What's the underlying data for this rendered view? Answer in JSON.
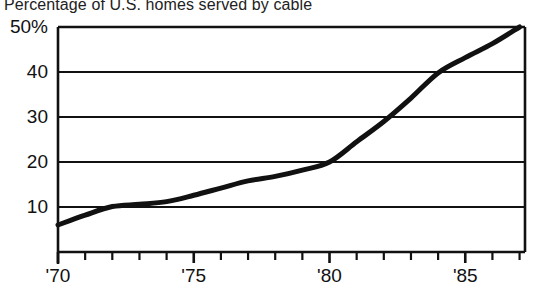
{
  "chart_data": {
    "type": "line",
    "title": "Percentage of U.S. homes served by cable",
    "xlabel": "",
    "ylabel": "",
    "xlim": [
      1970,
      1987.2
    ],
    "ylim": [
      0,
      50
    ],
    "grid": true,
    "legend": false,
    "y_ticks": [
      {
        "value": 50,
        "label": "50%"
      },
      {
        "value": 40,
        "label": "40"
      },
      {
        "value": 30,
        "label": "30"
      },
      {
        "value": 20,
        "label": "20"
      },
      {
        "value": 10,
        "label": "10"
      }
    ],
    "x_ticks_major": [
      {
        "value": 1970,
        "label": "'70"
      },
      {
        "value": 1975,
        "label": "'75"
      },
      {
        "value": 1980,
        "label": "'80"
      },
      {
        "value": 1985,
        "label": "'85"
      }
    ],
    "x_ticks_minor": [
      1971,
      1972,
      1973,
      1974,
      1976,
      1977,
      1978,
      1979,
      1981,
      1982,
      1983,
      1984,
      1986,
      1987
    ],
    "x": [
      1970,
      1971,
      1972,
      1973,
      1974,
      1975,
      1976,
      1977,
      1978,
      1979,
      1980,
      1981,
      1982,
      1983,
      1984,
      1985,
      1986,
      1987
    ],
    "values": [
      6.0,
      8.2,
      10.1,
      10.6,
      11.2,
      12.6,
      14.2,
      15.8,
      16.8,
      18.2,
      20.0,
      24.5,
      29.0,
      34.2,
      39.8,
      43.2,
      46.3,
      50.0
    ],
    "series": [
      {
        "name": "Percentage of U.S. homes served by cable",
        "color": "#111111",
        "line_width": 5,
        "values": [
          6.0,
          8.2,
          10.1,
          10.6,
          11.2,
          12.6,
          14.2,
          15.8,
          16.8,
          18.2,
          20.0,
          24.5,
          29.0,
          34.2,
          39.8,
          43.2,
          46.3,
          50.0
        ]
      }
    ],
    "colors": {
      "line": "#111111",
      "axis": "#111111",
      "grid": "#111111",
      "background": "#ffffff",
      "text": "#111111"
    }
  }
}
